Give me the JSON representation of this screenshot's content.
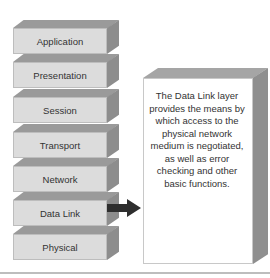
{
  "diagram": {
    "layers": [
      {
        "label": "Application"
      },
      {
        "label": "Presentation"
      },
      {
        "label": "Session"
      },
      {
        "label": "Transport"
      },
      {
        "label": "Network"
      },
      {
        "label": "Data Link"
      },
      {
        "label": "Physical"
      }
    ],
    "highlighted_layer": "Data Link",
    "description": "The Data Link layer provides the means by which access to the physical network medium is negotiated, as well as error checking and other basic functions.",
    "colors": {
      "block_front": "#dcdcdc",
      "block_top": "#9a9a9a",
      "block_side": "#8d8d8d",
      "arrow": "#333333",
      "text": "#333333"
    }
  }
}
